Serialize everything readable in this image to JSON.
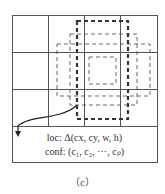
{
  "diagram": {
    "loc_label": "loc: Δ(cx, cy, w, h)",
    "conf_label": "conf: (c₁, c₂, ⋯, cₚ)",
    "caption": "（c）",
    "grid": {
      "cols": 4,
      "rows": 3,
      "bottom_row": "merged text cell"
    },
    "boxes": [
      "thick-dashed default box",
      "medium dashed box",
      "wide dashed box",
      "small inner dashed box"
    ]
  }
}
